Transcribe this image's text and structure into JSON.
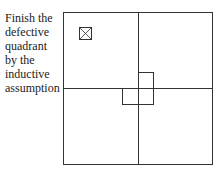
{
  "caption": {
    "lines": [
      "Finish the",
      "defective",
      "quadrant",
      "by the",
      "inductive",
      "assumption"
    ]
  },
  "diagram": {
    "stroke_color": "#333333",
    "outer_square": {
      "x": 63,
      "y": 12,
      "w": 149,
      "h": 152
    },
    "center": {
      "x": 138,
      "y": 88
    },
    "defect_marker": {
      "x": 79,
      "y": 27,
      "w": 12,
      "h": 12,
      "label": "crossed-box"
    },
    "tromino_squares": [
      {
        "x": 138,
        "y": 72,
        "w": 15,
        "h": 16
      },
      {
        "x": 138,
        "y": 88,
        "w": 15,
        "h": 16
      },
      {
        "x": 122,
        "y": 88,
        "w": 16,
        "h": 16
      }
    ]
  }
}
